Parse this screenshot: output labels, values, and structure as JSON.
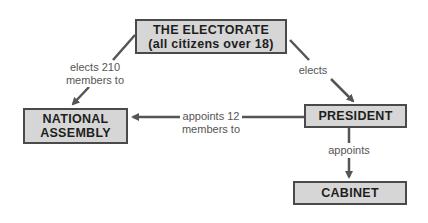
{
  "nodes": {
    "electorate": {
      "line1": "THE ELECTORATE",
      "line2": "(all citizens over 18)"
    },
    "national_assembly": {
      "line1": "NATIONAL",
      "line2": "ASSEMBLY"
    },
    "president": {
      "line1": "PRESIDENT"
    },
    "cabinet": {
      "line1": "CABINET"
    }
  },
  "edges": {
    "electorate_to_assembly": {
      "line1": "elects 210",
      "line2": "members to"
    },
    "electorate_to_president": {
      "line1": "elects"
    },
    "president_to_assembly": {
      "line1": "appoints 12",
      "line2": "members to"
    },
    "president_to_cabinet": {
      "line1": "appoints"
    }
  },
  "colors": {
    "box_fill": "#d6d6d6",
    "box_border": "#4a4a4a",
    "arrow": "#555555",
    "label_text": "#555555"
  }
}
